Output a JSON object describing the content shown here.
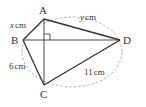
{
  "diagram": {
    "points": {
      "A": {
        "label": "A",
        "x": 44,
        "y": 19
      },
      "B": {
        "label": "B",
        "x": 23,
        "y": 40
      },
      "C": {
        "label": "C",
        "x": 44,
        "y": 85
      },
      "D": {
        "label": "D",
        "x": 120,
        "y": 40
      }
    },
    "edges": {
      "AB": "x cm",
      "AD": "y cm",
      "BC": "6 cm",
      "CD": "11 cm"
    },
    "labels": {
      "x_var": "x",
      "y_var": "y",
      "unit": "cm",
      "bc": "6",
      "cd": "11"
    },
    "right_angle_at": "intersection of AC and BD",
    "circumcircle": "dashed"
  }
}
